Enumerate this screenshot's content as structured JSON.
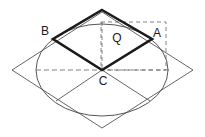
{
  "figure": {
    "background_color": "#ffffff",
    "width": 205,
    "height": 137
  },
  "colors": {
    "thick_stroke": "#1a1a1a",
    "thin_stroke": "#555555",
    "dashed_stroke": "#666666",
    "ellipse_stroke": "#444444",
    "label_color": "#1a1a1a"
  },
  "labels": [
    {
      "id": "label-B",
      "text": "B",
      "x": 45,
      "y": 32
    },
    {
      "id": "label-Q",
      "text": "Q",
      "x": 117,
      "y": 39
    },
    {
      "id": "label-A",
      "text": "A",
      "x": 157,
      "y": 34
    },
    {
      "id": "label-C",
      "text": "C",
      "x": 103,
      "y": 82
    }
  ],
  "points": {
    "top": {
      "x": 102,
      "y": 10
    },
    "A": {
      "x": 152,
      "y": 39
    },
    "B": {
      "x": 53,
      "y": 39
    },
    "C": {
      "x": 102,
      "y": 70
    },
    "square_top": {
      "x": 102,
      "y": 12
    },
    "square_right": {
      "x": 193,
      "y": 70
    },
    "square_bottom": {
      "x": 102,
      "y": 128
    },
    "square_left": {
      "x": 12,
      "y": 70
    },
    "lower_left_foot": {
      "x": 56,
      "y": 101
    },
    "lower_right_foot": {
      "x": 150,
      "y": 101
    }
  },
  "ellipse": {
    "cx": 102,
    "cy": 70,
    "rx": 66,
    "ry": 46
  },
  "dashed_rectangle": {
    "x": 101,
    "y": 22,
    "width": 65,
    "height": 48
  },
  "dashed_axes": {
    "horizontal": {
      "x1": 36,
      "y1": 70,
      "x2": 170,
      "y2": 70
    },
    "vertical": {
      "x1": 102,
      "y1": 22,
      "x2": 102,
      "y2": 70
    }
  },
  "paths": {
    "outer_square": "M 102 12 L 193 70 L 102 128 L 12 70 Z",
    "thick_rhombus": "M 102 10 L 152 39 L 102 70 L 53 39 Z",
    "diagonal_left": "M 102 70 L 56 101",
    "diagonal_right": "M 102 70 L 150 101"
  }
}
